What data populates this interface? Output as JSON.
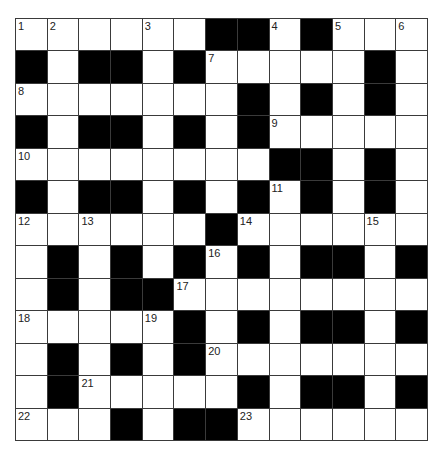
{
  "puzzle": {
    "rows": 13,
    "cols": 13,
    "colors": {
      "block": "#000000",
      "cell": "#ffffff",
      "line": "#3a3a3a"
    },
    "layout": [
      "0000001101000",
      "1011010000010",
      "0000000101010",
      "1011010100000",
      "0000000011010",
      "1011010101010",
      "0000001000000",
      "0101010101101",
      "0101100000000",
      "0000010101101",
      "0101010000000",
      "0100000101101",
      "0001011000000"
    ],
    "numbers": [
      {
        "n": "1",
        "r": 0,
        "c": 0
      },
      {
        "n": "2",
        "r": 0,
        "c": 1
      },
      {
        "n": "3",
        "r": 0,
        "c": 4
      },
      {
        "n": "4",
        "r": 0,
        "c": 8
      },
      {
        "n": "5",
        "r": 0,
        "c": 10
      },
      {
        "n": "6",
        "r": 0,
        "c": 12
      },
      {
        "n": "7",
        "r": 1,
        "c": 6
      },
      {
        "n": "8",
        "r": 2,
        "c": 0
      },
      {
        "n": "9",
        "r": 3,
        "c": 8
      },
      {
        "n": "10",
        "r": 4,
        "c": 0
      },
      {
        "n": "11",
        "r": 5,
        "c": 8
      },
      {
        "n": "12",
        "r": 6,
        "c": 0
      },
      {
        "n": "13",
        "r": 6,
        "c": 2
      },
      {
        "n": "14",
        "r": 6,
        "c": 7
      },
      {
        "n": "15",
        "r": 6,
        "c": 11
      },
      {
        "n": "16",
        "r": 7,
        "c": 6
      },
      {
        "n": "17",
        "r": 8,
        "c": 5
      },
      {
        "n": "18",
        "r": 9,
        "c": 0
      },
      {
        "n": "19",
        "r": 9,
        "c": 4
      },
      {
        "n": "20",
        "r": 10,
        "c": 6
      },
      {
        "n": "21",
        "r": 11,
        "c": 2
      },
      {
        "n": "22",
        "r": 12,
        "c": 0
      },
      {
        "n": "23",
        "r": 12,
        "c": 7
      }
    ]
  }
}
